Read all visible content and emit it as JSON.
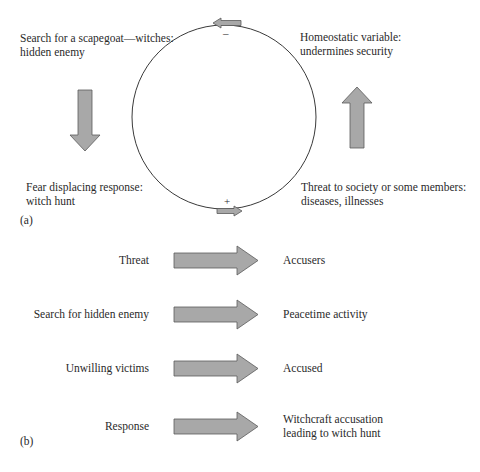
{
  "panel_a": {
    "label": "(a)",
    "nodes": {
      "top_left": [
        "Search for a scapegoat—witches:",
        "hidden enemy"
      ],
      "top_right": [
        "Homeostatic variable:",
        "undermines security"
      ],
      "bottom_left": [
        "Fear displacing response:",
        "witch hunt"
      ],
      "bottom_right": [
        "Threat to society or some members:",
        "diseases, illnesses"
      ]
    },
    "signs": {
      "top": "–",
      "bottom": "+"
    },
    "arrows": [
      {
        "name": "down-arrow",
        "direction": "down"
      },
      {
        "name": "up-arrow",
        "direction": "up"
      },
      {
        "name": "loop-top-arrow",
        "direction": "left"
      },
      {
        "name": "loop-bottom-arrow",
        "direction": "right"
      }
    ]
  },
  "panel_b": {
    "label": "(b)",
    "rows": [
      {
        "left": "Threat",
        "right": [
          "Accusers"
        ]
      },
      {
        "left": "Search for hidden enemy",
        "right": [
          "Peacetime activity"
        ]
      },
      {
        "left": "Unwilling victims",
        "right": [
          "Accused"
        ]
      },
      {
        "left": "Response",
        "right": [
          "Witchcraft accusation",
          "leading to witch hunt"
        ]
      }
    ]
  },
  "colors": {
    "arrow_fill": "#a8a8a8",
    "arrow_stroke": "#5a5a5a",
    "circle_stroke": "#3a3a3a",
    "text": "#2a2a2a"
  }
}
